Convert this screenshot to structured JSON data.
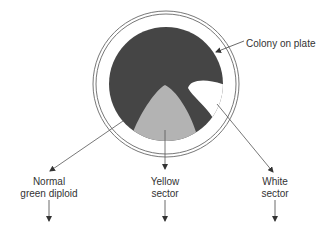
{
  "diagram": {
    "title_label": "Colony on plate",
    "colors": {
      "plate_ring": "#666666",
      "colony_green": "#444444",
      "yellow_sector": "#b0b0b0",
      "white_sector": "#ffffff",
      "line": "#444444",
      "text": "#333333"
    },
    "sectors": [
      {
        "id": "normal",
        "line1": "Normal",
        "line2": "green diploid"
      },
      {
        "id": "yellow",
        "line1": "Yellow",
        "line2": "sector"
      },
      {
        "id": "white",
        "line1": "White",
        "line2": "sector"
      }
    ]
  }
}
